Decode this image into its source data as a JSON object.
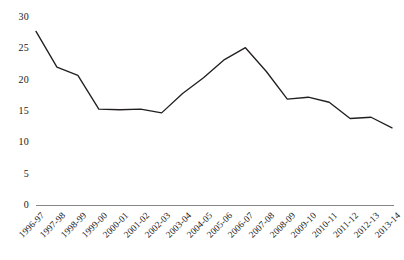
{
  "chart_data": {
    "type": "line",
    "title": "",
    "subtitle": "",
    "xlabel": "",
    "ylabel": "",
    "ylim": [
      0,
      30
    ],
    "y_ticks": [
      0,
      5,
      10,
      15,
      20,
      25,
      30
    ],
    "grid": false,
    "legend": false,
    "legend_position": "none",
    "x_tick_rotation": -45,
    "line_color": "#231f20",
    "axis_color": "#868686",
    "background_color": "#ffffff",
    "categories": [
      "1996-97",
      "1997-98",
      "1998-99",
      "1999-00",
      "2000-01",
      "2001-02",
      "2002-03",
      "2003-04",
      "2004-05",
      "2005-06",
      "2006-07",
      "2007-08",
      "2008-09",
      "2009-10",
      "2010-11",
      "2011-12",
      "2012-13",
      "2013-14"
    ],
    "values": [
      27.7,
      22.0,
      20.7,
      15.3,
      15.2,
      15.3,
      14.7,
      17.8,
      20.3,
      23.2,
      25.1,
      21.3,
      16.9,
      17.2,
      16.4,
      13.8,
      14.0,
      12.3
    ],
    "series": [
      {
        "name": "",
        "values": [
          27.7,
          22.0,
          20.7,
          15.3,
          15.2,
          15.3,
          14.7,
          17.8,
          20.3,
          23.2,
          25.1,
          21.3,
          16.9,
          17.2,
          16.4,
          13.8,
          14.0,
          12.3
        ]
      }
    ]
  }
}
